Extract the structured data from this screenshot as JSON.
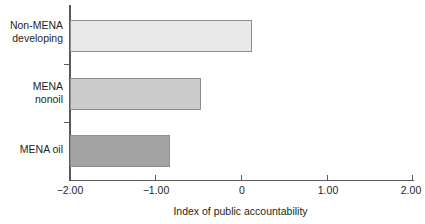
{
  "chart_data": {
    "type": "bar",
    "orientation": "horizontal",
    "title": "",
    "xlabel": "Index of public accountability",
    "ylabel": "",
    "categories": [
      "Non-MENA\ndeveloping",
      "MENA\nnonoil",
      "MENA oil"
    ],
    "values": [
      0.12,
      -0.47,
      -0.83
    ],
    "xlim": [
      -2.0,
      2.0
    ],
    "xticks": [
      -2.0,
      -1.0,
      0,
      1.0,
      2.0
    ],
    "xtick_labels": [
      "−2.00",
      "−1.00",
      "0",
      "1.00",
      "2.00"
    ],
    "grid": false,
    "legend": false,
    "bar_colors": [
      "#e8e8e8",
      "#cccccc",
      "#a3a3a3"
    ],
    "bar_edge_color": "#8d8d8d",
    "axis_color": "#58595b",
    "text_color": "#231f20",
    "series": [
      {
        "name": "Index of public accountability",
        "points": [
          {
            "category": "Non-MENA developing",
            "value": 0.12
          },
          {
            "category": "MENA nonoil",
            "value": -0.47
          },
          {
            "category": "MENA oil",
            "value": -0.83
          }
        ]
      }
    ]
  }
}
